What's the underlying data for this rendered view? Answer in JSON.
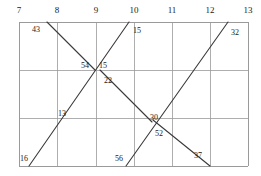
{
  "figure": {
    "kind": "line-segment-grid-diagram",
    "background": "#ffffff",
    "grid_color": "#9a9a9a",
    "line_color": "#3a3a3a",
    "text_color": "#1a1a1a",
    "plot_area": {
      "left": 19,
      "top": 22,
      "right": 248,
      "bottom": 166
    },
    "rows": 3,
    "columns": 6
  },
  "axis": {
    "position": "top",
    "ticks": [
      {
        "label": "7",
        "x": 19
      },
      {
        "label": "8",
        "x": 57
      },
      {
        "label": "9",
        "x": 96
      },
      {
        "label": "10",
        "x": 134
      },
      {
        "label": "11",
        "x": 172
      },
      {
        "label": "12",
        "x": 210
      },
      {
        "label": "13",
        "x": 248
      }
    ]
  },
  "grid": {
    "vertical_x": [
      19,
      57,
      96,
      134,
      172,
      210,
      248
    ],
    "horizontal_y": [
      22,
      70,
      118,
      166
    ]
  },
  "segments": [
    {
      "name": "segment-43-54",
      "from": [
        47,
        22
      ],
      "to": [
        95,
        70
      ]
    },
    {
      "name": "segment-16-15",
      "from": [
        29,
        166
      ],
      "to": [
        129,
        22
      ]
    },
    {
      "name": "segment-22-30",
      "from": [
        100,
        70
      ],
      "to": [
        152,
        122
      ]
    },
    {
      "name": "segment-56-32",
      "from": [
        126,
        166
      ],
      "to": [
        228,
        22
      ]
    },
    {
      "name": "segment-52-37",
      "from": [
        153,
        120
      ],
      "to": [
        210,
        166
      ]
    }
  ],
  "point_labels": [
    {
      "name": "label-43",
      "text": "43",
      "x": 32,
      "y": 26
    },
    {
      "name": "label-15-top",
      "text": "15",
      "x": 133,
      "y": 27
    },
    {
      "name": "label-32",
      "text": "32",
      "x": 231,
      "y": 29
    },
    {
      "name": "label-54",
      "text": "54",
      "x": 81,
      "y": 62
    },
    {
      "name": "label-15-mid",
      "text": "15",
      "x": 99,
      "y": 62
    },
    {
      "name": "label-22",
      "text": "22",
      "x": 104,
      "y": 77
    },
    {
      "name": "label-13",
      "text": "13",
      "x": 58,
      "y": 110
    },
    {
      "name": "label-30",
      "text": "30",
      "x": 150,
      "y": 114
    },
    {
      "name": "label-52",
      "text": "52",
      "x": 155,
      "y": 130
    },
    {
      "name": "label-16",
      "text": "16",
      "x": 20,
      "y": 155
    },
    {
      "name": "label-56",
      "text": "56",
      "x": 115,
      "y": 155
    },
    {
      "name": "label-37",
      "text": "37",
      "x": 194,
      "y": 152
    }
  ]
}
